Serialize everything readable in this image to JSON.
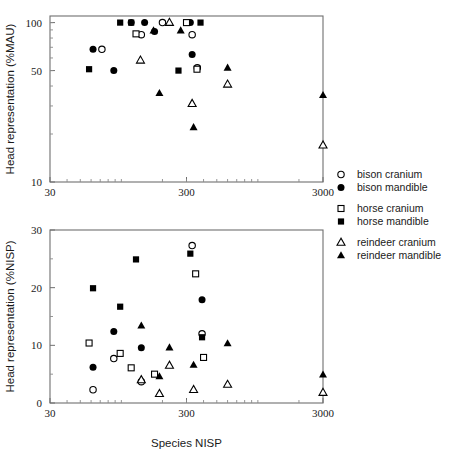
{
  "figure": {
    "width": 452,
    "height": 461,
    "background": "#ffffff",
    "foreground": "#000000",
    "axis_color": "#6f6f6f"
  },
  "legend": {
    "position": "right",
    "entries": [
      {
        "label": "bison cranium",
        "marker": "circle",
        "fill": "open",
        "group": "bison"
      },
      {
        "label": "bison mandible",
        "marker": "circle",
        "fill": "filled",
        "group": "bison"
      },
      {
        "label": "horse cranium",
        "marker": "square",
        "fill": "open",
        "group": "horse"
      },
      {
        "label": "horse mandible",
        "marker": "square",
        "fill": "filled",
        "group": "horse"
      },
      {
        "label": "reindeer cranium",
        "marker": "triangle",
        "fill": "open",
        "group": "reindeer"
      },
      {
        "label": "reindeer mandible",
        "marker": "triangle",
        "fill": "filled",
        "group": "reindeer"
      }
    ]
  },
  "chart_data": [
    {
      "id": "panel-top",
      "type": "scatter",
      "title": "",
      "xlabel": "",
      "ylabel": "Head representation (%MAU)",
      "xscale": "log",
      "yscale": "log",
      "xlim": [
        30,
        3000
      ],
      "ylim": [
        10,
        110
      ],
      "xticks": [
        30,
        300,
        3000
      ],
      "xticklabels": [
        "30",
        "300",
        "3000"
      ],
      "yticks": [
        10,
        50,
        100
      ],
      "yticklabels": [
        "10",
        "50",
        "100"
      ],
      "grid": false,
      "series": [
        {
          "name": "bison cranium",
          "marker": "circle",
          "fill": "open",
          "points": [
            [
              72,
              68
            ],
            [
              140,
              84
            ],
            [
              200,
              100
            ],
            [
              330,
              84
            ],
            [
              360,
              52
            ]
          ]
        },
        {
          "name": "bison mandible",
          "marker": "circle",
          "fill": "filled",
          "points": [
            [
              62,
              68
            ],
            [
              88,
              50
            ],
            [
              118,
              100
            ],
            [
              148,
              100
            ],
            [
              175,
              88
            ],
            [
              320,
              100
            ],
            [
              330,
              63
            ]
          ]
        },
        {
          "name": "horse cranium",
          "marker": "square",
          "fill": "open",
          "points": [
            [
              128,
              85
            ],
            [
              300,
              100
            ],
            [
              358,
              51
            ]
          ]
        },
        {
          "name": "horse mandible",
          "marker": "square",
          "fill": "filled",
          "points": [
            [
              58,
              51
            ],
            [
              98,
              100
            ],
            [
              118,
              100
            ],
            [
              262,
              50
            ],
            [
              380,
              100
            ]
          ]
        },
        {
          "name": "reindeer cranium",
          "marker": "triangle",
          "fill": "open",
          "points": [
            [
              138,
              58
            ],
            [
              225,
              100
            ],
            [
              330,
              31
            ],
            [
              600,
              41
            ],
            [
              3000,
              17
            ]
          ]
        },
        {
          "name": "reindeer mandible",
          "marker": "triangle",
          "fill": "filled",
          "points": [
            [
              172,
              89
            ],
            [
              190,
              36
            ],
            [
              272,
              89
            ],
            [
              338,
              22
            ],
            [
              600,
              52
            ],
            [
              3000,
              35
            ]
          ]
        }
      ]
    },
    {
      "id": "panel-bottom",
      "type": "scatter",
      "title": "",
      "xlabel": "Species NISP",
      "ylabel": "Head representation (%NISP)",
      "xscale": "log",
      "yscale": "linear",
      "xlim": [
        30,
        3000
      ],
      "ylim": [
        0,
        30
      ],
      "xticks": [
        30,
        300,
        3000
      ],
      "xticklabels": [
        "30",
        "300",
        "3000"
      ],
      "yticks": [
        0,
        10,
        20,
        30
      ],
      "yticklabels": [
        "0",
        "10",
        "20",
        "30"
      ],
      "grid": false,
      "series": [
        {
          "name": "bison cranium",
          "marker": "circle",
          "fill": "open",
          "points": [
            [
              62,
              2.3
            ],
            [
              88,
              7.7
            ],
            [
              140,
              3.7
            ],
            [
              330,
              27.3
            ],
            [
              390,
              12.0
            ]
          ]
        },
        {
          "name": "bison mandible",
          "marker": "circle",
          "fill": "filled",
          "points": [
            [
              62,
              6.2
            ],
            [
              88,
              12.4
            ],
            [
              140,
              9.6
            ],
            [
              390,
              17.9
            ]
          ]
        },
        {
          "name": "horse cranium",
          "marker": "square",
          "fill": "open",
          "points": [
            [
              58,
              10.4
            ],
            [
              98,
              8.6
            ],
            [
              118,
              6.1
            ],
            [
              175,
              5.0
            ],
            [
              350,
              22.4
            ],
            [
              400,
              7.9
            ]
          ]
        },
        {
          "name": "horse mandible",
          "marker": "square",
          "fill": "filled",
          "points": [
            [
              62,
              19.9
            ],
            [
              98,
              16.7
            ],
            [
              128,
              24.9
            ],
            [
              320,
              25.9
            ],
            [
              390,
              11.4
            ]
          ]
        },
        {
          "name": "reindeer cranium",
          "marker": "triangle",
          "fill": "open",
          "points": [
            [
              140,
              4.0
            ],
            [
              190,
              1.6
            ],
            [
              225,
              6.5
            ],
            [
              338,
              2.3
            ],
            [
              600,
              3.2
            ],
            [
              3000,
              1.8
            ]
          ]
        },
        {
          "name": "reindeer mandible",
          "marker": "triangle",
          "fill": "filled",
          "points": [
            [
              140,
              13.4
            ],
            [
              190,
              4.6
            ],
            [
              225,
              9.6
            ],
            [
              338,
              6.6
            ],
            [
              600,
              10.3
            ],
            [
              3000,
              4.9
            ]
          ]
        }
      ]
    }
  ]
}
